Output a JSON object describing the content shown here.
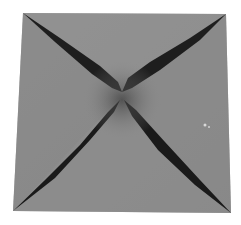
{
  "image": {
    "subject": "folded gray paper square with diagonal creases forming an X",
    "alt": "Origami fortune-teller base: gray square with dark X-shaped folds",
    "colors": {
      "background": "#ffffff",
      "paper": "#8c8c8c",
      "paper_light": "#959595",
      "paper_dark": "#7e7e7e",
      "crease": "#1c1c1c"
    },
    "corners": {
      "top_left": [
        23,
        13
      ],
      "top_right": [
        226,
        14
      ],
      "bottom_right": [
        231,
        213
      ],
      "bottom_left": [
        13,
        211
      ],
      "center": [
        122,
        95
      ]
    }
  }
}
